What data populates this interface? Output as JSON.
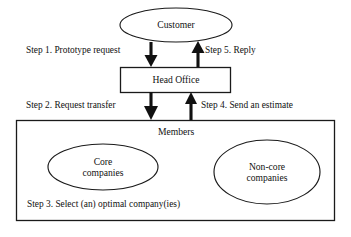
{
  "diagram": {
    "nodes": {
      "customer": {
        "label": "Customer",
        "shape": "ellipse"
      },
      "head_office": {
        "label": "Head Office",
        "shape": "rectangle"
      },
      "members_group": {
        "label": "Members",
        "shape": "rectangle"
      },
      "core_companies": {
        "label_line1": "Core",
        "label_line2": "companies",
        "shape": "ellipse"
      },
      "non_core_companies": {
        "label_line1": "Non-core",
        "label_line2": "companies",
        "shape": "ellipse"
      }
    },
    "steps": [
      {
        "id": "step1",
        "label": "Step 1. Prototype request",
        "direction": "down",
        "from": "customer",
        "to": "head_office"
      },
      {
        "id": "step5",
        "label": "Step 5. Reply",
        "direction": "up",
        "from": "head_office",
        "to": "customer"
      },
      {
        "id": "step2",
        "label": "Step 2. Request transfer",
        "direction": "down",
        "from": "head_office",
        "to": "members_group"
      },
      {
        "id": "step4",
        "label": "Step 4. Send an estimate",
        "direction": "up",
        "from": "members_group",
        "to": "head_office"
      },
      {
        "id": "step3",
        "label": "Step 3. Select (an) optimal company(ies)",
        "direction": "none",
        "from": "members_group",
        "to": "members_group"
      }
    ],
    "colors": {
      "stroke": "#1a1a1a",
      "arrow": "#111111",
      "background": "#ffffff",
      "text": "#111111"
    }
  }
}
